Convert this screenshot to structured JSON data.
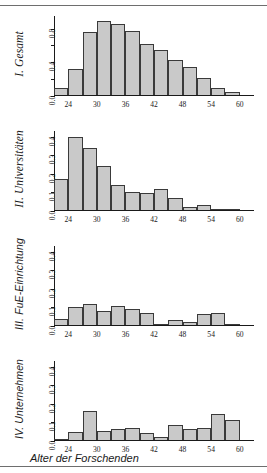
{
  "figure": {
    "xaxis_title": "Alter der Forschenden",
    "bar_fill_color": "#c9c9c9",
    "bar_edge_color": "#3a3a3a",
    "axis_color": "#1a1a1a"
  },
  "chart_data": [
    {
      "type": "bar",
      "title": "I. Gesamt",
      "xlabel": "Alter der Forschenden",
      "ylabel": "",
      "xlim": [
        21,
        63
      ],
      "ylim": [
        0,
        0.95
      ],
      "grid": false,
      "legend": "none",
      "xticks": [
        24,
        30,
        36,
        42,
        48,
        54,
        60
      ],
      "xtick_labels": [
        "24",
        "30",
        "36",
        "42",
        "48",
        "54",
        "60"
      ],
      "yticks": [
        0.0,
        0.2,
        0.4,
        0.6,
        0.8
      ],
      "ytick_labels": [
        "0.0",
        "",
        "0.4",
        "",
        "0.8"
      ],
      "categories": [
        22.5,
        25.5,
        28.5,
        31.5,
        34.5,
        37.5,
        40.5,
        43.5,
        46.5,
        49.5,
        52.5,
        55.5,
        58.5
      ],
      "values": [
        0.09,
        0.32,
        0.76,
        0.89,
        0.85,
        0.77,
        0.62,
        0.55,
        0.43,
        0.34,
        0.21,
        0.09,
        0.05
      ]
    },
    {
      "type": "bar",
      "title": "II. Universitäten",
      "xlabel": "Alter der Forschenden",
      "ylabel": "",
      "xlim": [
        21,
        63
      ],
      "ylim": [
        0,
        0.43
      ],
      "grid": false,
      "legend": "none",
      "xticks": [
        24,
        30,
        36,
        42,
        48,
        54,
        60
      ],
      "xtick_labels": [
        "24",
        "30",
        "36",
        "42",
        "48",
        "54",
        "60"
      ],
      "yticks": [
        0.0,
        0.1,
        0.2,
        0.3,
        0.4
      ],
      "ytick_labels": [
        "0.0",
        "0.1",
        "0.2",
        "0.3",
        "0.4"
      ],
      "categories": [
        22.5,
        25.5,
        28.5,
        31.5,
        34.5,
        37.5,
        40.5,
        43.5,
        46.5,
        49.5,
        52.5,
        55.5,
        58.5
      ],
      "values": [
        0.17,
        0.4,
        0.34,
        0.24,
        0.14,
        0.1,
        0.095,
        0.12,
        0.07,
        0.02,
        0.03,
        0.003,
        0.003
      ]
    },
    {
      "type": "bar",
      "title": "III. FuE-Einrichtung",
      "xlabel": "Alter der Forschenden",
      "ylabel": "",
      "xlim": [
        21,
        63
      ],
      "ylim": [
        0,
        0.43
      ],
      "grid": false,
      "legend": "none",
      "xticks": [
        24,
        30,
        36,
        42,
        48,
        54,
        60
      ],
      "xtick_labels": [
        "24",
        "30",
        "36",
        "42",
        "48",
        "54",
        "60"
      ],
      "yticks": [
        0.0,
        0.1,
        0.2,
        0.3,
        0.4
      ],
      "ytick_labels": [
        "0.0",
        "0.1",
        "0.2",
        "0.3",
        "0.4"
      ],
      "categories": [
        22.5,
        25.5,
        28.5,
        31.5,
        34.5,
        37.5,
        40.5,
        43.5,
        46.5,
        49.5,
        52.5,
        55.5,
        58.5
      ],
      "values": [
        0.04,
        0.1,
        0.12,
        0.08,
        0.11,
        0.09,
        0.07,
        0.008,
        0.03,
        0.02,
        0.065,
        0.072,
        0.003
      ]
    },
    {
      "type": "bar",
      "title": "IV. Unternehmen",
      "xlabel": "Alter der Forschenden",
      "ylabel": "",
      "xlim": [
        21,
        63
      ],
      "ylim": [
        0,
        0.43
      ],
      "grid": false,
      "legend": "none",
      "xticks": [
        24,
        30,
        36,
        42,
        48,
        54,
        60
      ],
      "xtick_labels": [
        "24",
        "30",
        "36",
        "42",
        "48",
        "54",
        "60"
      ],
      "yticks": [
        0.0,
        0.1,
        0.2,
        0.3,
        0.4
      ],
      "ytick_labels": [
        "0.0",
        "0.1",
        "0.2",
        "0.3",
        "0.4"
      ],
      "categories": [
        22.5,
        25.5,
        28.5,
        31.5,
        34.5,
        37.5,
        40.5,
        43.5,
        46.5,
        49.5,
        52.5,
        55.5,
        58.5
      ],
      "values": [
        0.004,
        0.05,
        0.16,
        0.052,
        0.065,
        0.071,
        0.045,
        0.022,
        0.085,
        0.063,
        0.069,
        0.147,
        0.115
      ]
    }
  ]
}
